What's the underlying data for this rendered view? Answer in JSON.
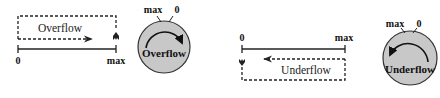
{
  "overflow_panel": {
    "axis": {
      "start_label": "0",
      "end_label": "max"
    },
    "box_label": "Overflow",
    "dial": {
      "label": "Overflow",
      "top_left_label": "max",
      "top_right_label": "0",
      "direction": "clockwise",
      "fill_color": "#c8c8c8"
    }
  },
  "underflow_panel": {
    "axis": {
      "start_label": "0",
      "end_label": "max"
    },
    "box_label": "Underflow",
    "dial": {
      "label": "Underflow",
      "top_left_label": "max",
      "top_right_label": "0",
      "direction": "counterclockwise",
      "fill_color": "#c8c8c8"
    }
  },
  "colors": {
    "stroke": "#222222",
    "dial_fill": "#c8c8c8",
    "background": "#ffffff"
  }
}
